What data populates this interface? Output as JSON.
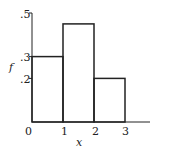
{
  "chart_data": {
    "type": "bar",
    "subtype": "histogram",
    "title": "",
    "xlabel": "x",
    "ylabel": "f",
    "bins": [
      [
        0,
        1
      ],
      [
        1,
        2
      ],
      [
        2,
        3
      ]
    ],
    "categories": [
      "0-1",
      "1-2",
      "2-3"
    ],
    "values": [
      0.3,
      0.45,
      0.2
    ],
    "x_ticks": [
      "0",
      "1",
      "2",
      "3"
    ],
    "y_ticks": [
      ".2",
      ".3",
      ".5"
    ],
    "xlim": [
      0,
      4
    ],
    "ylim": [
      0,
      0.5
    ],
    "grid": false,
    "legend": null
  },
  "style": {
    "line_color": "#222222",
    "background": "#ffffff"
  }
}
